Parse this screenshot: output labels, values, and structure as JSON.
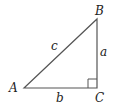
{
  "diagram": {
    "type": "right-triangle",
    "vertices": [
      {
        "id": "A",
        "label": "A",
        "x": 24,
        "y": 88
      },
      {
        "id": "B",
        "label": "B",
        "x": 97,
        "y": 19
      },
      {
        "id": "C",
        "label": "C",
        "x": 97,
        "y": 88
      }
    ],
    "sides": [
      {
        "id": "a",
        "label": "a",
        "from": "B",
        "to": "C"
      },
      {
        "id": "b",
        "label": "b",
        "from": "A",
        "to": "C"
      },
      {
        "id": "c",
        "label": "c",
        "from": "A",
        "to": "B"
      }
    ],
    "right_angle_at": "C",
    "colors": {
      "stroke": "#555555",
      "text": "#222222",
      "background": "#ffffff"
    }
  }
}
